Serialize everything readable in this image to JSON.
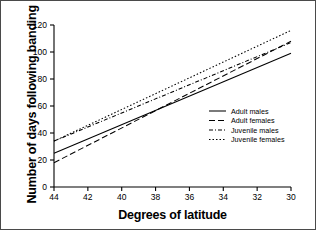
{
  "figure": {
    "background_color": "#ffffff",
    "border_color": "#4a4a4a",
    "line_color": "#000000"
  },
  "chart_data": {
    "type": "line",
    "title": "",
    "xlabel": "Degrees of latitude",
    "ylabel": "Number of days following banding",
    "xlim": [
      44,
      30
    ],
    "ylim": [
      0,
      120
    ],
    "x_reversed": true,
    "grid": false,
    "legend_position": "center right",
    "xticks": [
      44,
      42,
      40,
      38,
      36,
      34,
      32,
      30
    ],
    "xticklabels": [
      "44",
      "42",
      "40",
      "38",
      "36",
      "34",
      "32",
      "30"
    ],
    "yticks": [
      0,
      20,
      40,
      60,
      80,
      100,
      120
    ],
    "yticklabels": [
      "0",
      "20",
      "40",
      "60",
      "80",
      "100",
      "120"
    ],
    "series": [
      {
        "name": "Adult males",
        "style": "solid",
        "dasharray": "",
        "x": [
          44,
          30
        ],
        "values": [
          25,
          99
        ]
      },
      {
        "name": "Adult females",
        "style": "dashed",
        "dasharray": "6 3",
        "x": [
          44,
          30
        ],
        "values": [
          18,
          108
        ]
      },
      {
        "name": "Juvenile males",
        "style": "dash-dot",
        "dasharray": "4 2 1 2",
        "x": [
          44,
          30
        ],
        "values": [
          34,
          107
        ]
      },
      {
        "name": "Juvenile females",
        "style": "dotted",
        "dasharray": "1.5 2",
        "x": [
          44,
          30
        ],
        "values": [
          34,
          116
        ]
      }
    ]
  },
  "legend": {
    "entries": [
      {
        "label": "Adult males"
      },
      {
        "label": "Adult females"
      },
      {
        "label": "Juvenile males"
      },
      {
        "label": "Juvenile females"
      }
    ]
  }
}
